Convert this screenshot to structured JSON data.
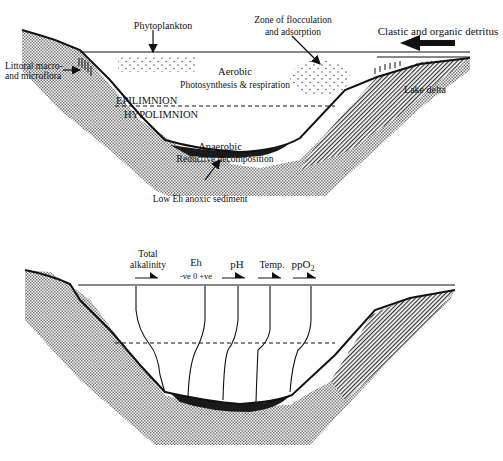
{
  "top_panel": {
    "labels": {
      "phytoplankton": "Phytoplankton",
      "zone_line1": "Zone of flocculation",
      "zone_line2": "and adsorption",
      "clastic": "Clastic and organic detritus",
      "littoral_line1": "Littoral macro-",
      "littoral_line2": "and microflora",
      "aerobic": "Aerobic",
      "photosynthesis": "Photosynthesis & respiration",
      "lake_delta": "Lake delta",
      "epilimnion": "EPILIMNION",
      "hypolimnion": "HYPOLIMNION",
      "anaerobic": "Anaerobic",
      "reductive": "Reductive decomposition",
      "low_eh": "Low Eh anoxic sediment"
    }
  },
  "bottom_panel": {
    "profiles": [
      {
        "name": "Total alkalinity",
        "line1": "Total",
        "line2": "alkalinity"
      },
      {
        "name": "Eh",
        "line1": "Eh",
        "scale": "-ve  0  +ve"
      },
      {
        "name": "pH",
        "line1": "pH"
      },
      {
        "name": "Temp.",
        "line1": "Temp."
      },
      {
        "name": "ppO2",
        "line1": "ppO",
        "sub": "2"
      }
    ]
  },
  "colors": {
    "ink": "#111111",
    "sediment_fill": "#bdbdbd",
    "anoxic_sediment": "#1a1a1a"
  }
}
